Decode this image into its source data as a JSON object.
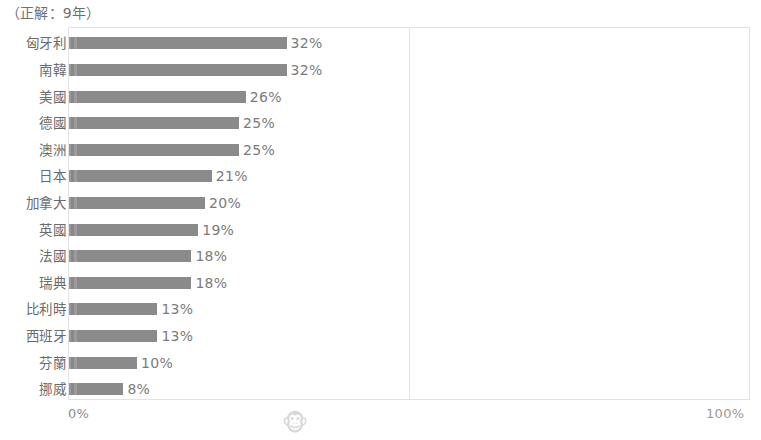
{
  "title": "（正解：9年）",
  "axis": {
    "min_label": "0%",
    "max_label": "100%"
  },
  "watermark": {
    "icon": "monkey-face-icon",
    "glyph": "🐵"
  },
  "colors": {
    "bar": "#8e8e8e",
    "text": "#6b6b6b",
    "value_text": "#7b7b7b",
    "border": "#e2e2e2",
    "gridline": "#e6e6e6",
    "background": "#ffffff"
  },
  "chart_data": {
    "type": "bar",
    "orientation": "horizontal",
    "title": "（正解：9年）",
    "xlabel": "",
    "ylabel": "",
    "xlim": [
      0,
      100
    ],
    "xticks": [
      0,
      50,
      100
    ],
    "xtick_labels": [
      "0%",
      "",
      "100%"
    ],
    "grid": true,
    "legend": "none",
    "value_suffix": "%",
    "categories": [
      "匈牙利",
      "南韓",
      "美國",
      "德國",
      "澳洲",
      "日本",
      "加拿大",
      "英國",
      "法國",
      "瑞典",
      "比利時",
      "西班牙",
      "芬蘭",
      "挪威"
    ],
    "values": [
      32,
      32,
      26,
      25,
      25,
      21,
      20,
      19,
      18,
      18,
      13,
      13,
      10,
      8
    ],
    "value_labels": [
      "32%",
      "32%",
      "26%",
      "25%",
      "25%",
      "21%",
      "20%",
      "19%",
      "18%",
      "18%",
      "13%",
      "13%",
      "10%",
      "8%"
    ]
  }
}
